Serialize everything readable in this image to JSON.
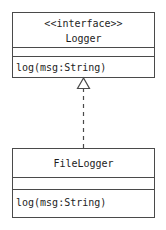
{
  "diagram": {
    "type": "uml-class-diagram",
    "background_color": "#ffffff",
    "line_color": "#4a4a4a",
    "text_color": "#1d1d1d",
    "classes": [
      {
        "id": "logger",
        "stereotype": "<<interface>>",
        "name": "Logger",
        "attributes": [],
        "operations": [
          "log(msg:String)"
        ]
      },
      {
        "id": "filelogger",
        "stereotype": "",
        "name": "FileLogger",
        "attributes": [],
        "operations": [
          "log(msg:String)"
        ]
      }
    ],
    "relationships": [
      {
        "id": "realization",
        "kind": "realization",
        "label": "",
        "source": "FileLogger",
        "target": "Logger",
        "line_style": "dashed",
        "arrowhead": "hollow-triangle"
      }
    ]
  }
}
